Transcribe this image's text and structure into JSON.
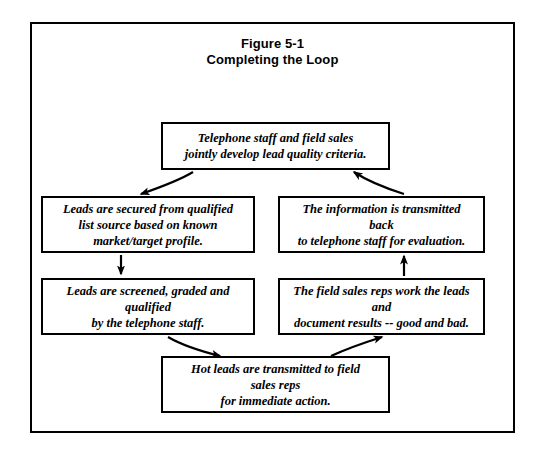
{
  "figure": {
    "title_line1": "Figure 5-1",
    "title_line2": "Completing the Loop"
  },
  "diagram": {
    "type": "cycle-flowchart",
    "direction": "clockwise",
    "nodes": {
      "top": {
        "id": "telephone-staff-field-sales",
        "line1": "Telephone staff and field sales",
        "line2": "jointly develop lead quality criteria."
      },
      "left_upper": {
        "id": "leads-secured",
        "line1": "Leads are secured from qualified",
        "line2": "list source based on known",
        "line3": "market/target profile."
      },
      "right_upper": {
        "id": "information-transmitted-back",
        "line1": "The information is transmitted",
        "line2": "back",
        "line3": "to telephone staff for evaluation."
      },
      "left_lower": {
        "id": "leads-screened-graded",
        "line1": "Leads are screened, graded and",
        "line2": "qualified",
        "line3": "by the telephone staff."
      },
      "right_lower": {
        "id": "field-sales-reps-work-leads",
        "line1": "The field sales reps work the leads",
        "line2": "and",
        "line3": "document results -- good and bad."
      },
      "bottom": {
        "id": "hot-leads-transmitted",
        "line1": "Hot leads are transmitted to field",
        "line2": "sales reps",
        "line3": "for immediate action."
      }
    },
    "edges": [
      {
        "from": "top",
        "to": "left_upper",
        "style": "curved-diagonal"
      },
      {
        "from": "left_upper",
        "to": "left_lower",
        "style": "vertical-down"
      },
      {
        "from": "left_lower",
        "to": "bottom",
        "style": "curved-diagonal"
      },
      {
        "from": "bottom",
        "to": "right_lower",
        "style": "curved-diagonal"
      },
      {
        "from": "right_lower",
        "to": "right_upper",
        "style": "vertical-up"
      },
      {
        "from": "right_upper",
        "to": "top",
        "style": "curved-diagonal"
      }
    ]
  },
  "colors": {
    "ink": "#000000",
    "page": "#ffffff"
  }
}
